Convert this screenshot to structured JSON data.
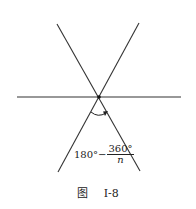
{
  "diagram": {
    "type": "three intersecting lines (hexagon vertex angles)",
    "center": {
      "x": 99,
      "y": 97
    },
    "lines": [
      {
        "name": "horizontal-line",
        "x1": 17,
        "y1": 97,
        "x2": 181,
        "y2": 97
      },
      {
        "name": "diagonal-line-1",
        "x1": 57,
        "y1": 24,
        "x2": 140,
        "y2": 171
      },
      {
        "name": "diagonal-line-2",
        "x1": 139,
        "y1": 23,
        "x2": 58,
        "y2": 172
      }
    ],
    "angle_label": {
      "left": "180°−",
      "numerator": "360°",
      "denominator": "n"
    },
    "caption": {
      "prefix": "图",
      "id": "I-8"
    },
    "colors": {
      "line": "#333333",
      "background": "#ffffff"
    }
  }
}
